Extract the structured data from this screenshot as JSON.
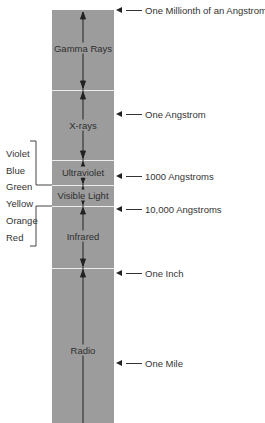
{
  "diagram": {
    "type": "electromagnetic-spectrum",
    "column_color": "#9c9c9c",
    "bands": [
      {
        "label": "Gamma Rays",
        "top": 10,
        "bottom": 90,
        "label_y": 48
      },
      {
        "label": "X-rays",
        "top": 90,
        "bottom": 160,
        "label_y": 125
      },
      {
        "label": "Ultraviolet",
        "top": 160,
        "bottom": 185,
        "label_y": 172
      },
      {
        "label": "Visible Light",
        "top": 185,
        "bottom": 206,
        "label_y": 195
      },
      {
        "label": "Infrared",
        "top": 206,
        "bottom": 268,
        "label_y": 236
      },
      {
        "label": "Radio",
        "top": 268,
        "bottom": 423,
        "label_y": 350
      }
    ],
    "wavelength_markers": [
      {
        "label": "One Millionth of an Angstrom",
        "y": 10
      },
      {
        "label": "One Angstrom",
        "y": 114
      },
      {
        "label": "1000 Angstroms",
        "y": 176
      },
      {
        "label": "10,000 Angstroms",
        "y": 209
      },
      {
        "label": "One Inch",
        "y": 273
      },
      {
        "label": "One Mile",
        "y": 363
      }
    ],
    "visible_colors": [
      {
        "label": "Violet",
        "y": 153
      },
      {
        "label": "Blue",
        "y": 170
      },
      {
        "label": "Green",
        "y": 186
      },
      {
        "label": "Yellow",
        "y": 203
      },
      {
        "label": "Orange",
        "y": 220
      },
      {
        "label": "Red",
        "y": 237
      }
    ]
  }
}
